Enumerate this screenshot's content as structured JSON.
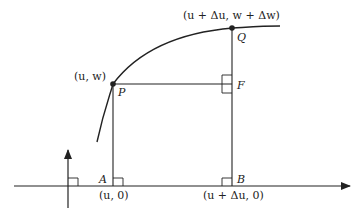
{
  "diagram": {
    "labels": {
      "point_p_coords": "(u, w)",
      "point_p": "P",
      "point_q_coords": "(u + Δu, w + Δw)",
      "point_q": "Q",
      "point_f": "F",
      "point_a": "A",
      "point_a_coords": "(u, 0)",
      "point_b": "B",
      "point_b_coords": "(u + Δu, 0)"
    },
    "colors": {
      "stroke": "#222222",
      "background": "#ffffff"
    }
  }
}
